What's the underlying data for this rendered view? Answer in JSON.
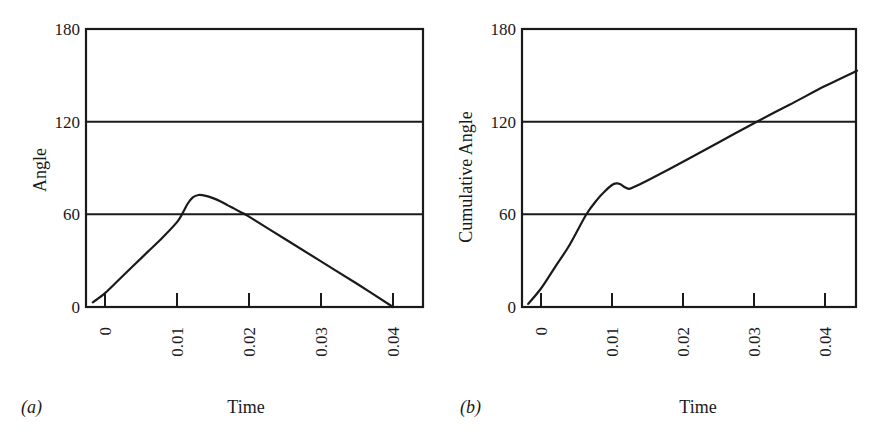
{
  "chart_data": [
    {
      "id": "a",
      "type": "line",
      "panel_label": "(a)",
      "title": "",
      "xlabel": "Time",
      "ylabel": "Angle",
      "xlim": [
        -0.0026,
        0.0442
      ],
      "ylim": [
        0,
        180
      ],
      "x_ticks": [
        0,
        0.01,
        0.02,
        0.03,
        0.04
      ],
      "x_tick_labels": [
        "0",
        "0.01",
        "0.02",
        "0.03",
        "0.04"
      ],
      "y_ticks": [
        0,
        60,
        120,
        180
      ],
      "y_tick_labels": [
        "0",
        "60",
        "120",
        "180"
      ],
      "horizontal_gridlines": [
        60,
        120
      ],
      "legend": null,
      "series": [
        {
          "name": "Angle",
          "x": [
            -0.0017,
            0.0,
            0.002,
            0.004,
            0.006,
            0.008,
            0.01,
            0.0108,
            0.0115,
            0.0122,
            0.013,
            0.014,
            0.015,
            0.016,
            0.017,
            0.018,
            0.019,
            0.02,
            0.025,
            0.03,
            0.035,
            0.04
          ],
          "y": [
            3,
            9,
            18,
            27,
            36,
            45,
            55,
            61,
            67,
            71,
            72.5,
            72,
            70.5,
            68.5,
            66,
            63.5,
            61,
            58.5,
            44,
            29.5,
            15,
            0
          ]
        }
      ]
    },
    {
      "id": "b",
      "type": "line",
      "panel_label": "(b)",
      "title": "",
      "xlabel": "Time",
      "ylabel": "Cumulative Angle",
      "xlim": [
        -0.0026,
        0.0443
      ],
      "ylim": [
        0,
        180
      ],
      "x_ticks": [
        0,
        0.01,
        0.02,
        0.03,
        0.04
      ],
      "x_tick_labels": [
        "0",
        "0.01",
        "0.02",
        "0.03",
        "0.04"
      ],
      "y_ticks": [
        0,
        60,
        120,
        180
      ],
      "y_tick_labels": [
        "0",
        "60",
        "120",
        "180"
      ],
      "horizontal_gridlines": [
        60,
        120
      ],
      "legend": null,
      "series": [
        {
          "name": "Cumulative Angle",
          "x": [
            -0.0018,
            0.0,
            0.002,
            0.004,
            0.0064,
            0.008,
            0.009,
            0.01,
            0.0106,
            0.0112,
            0.0118,
            0.0124,
            0.013,
            0.015,
            0.02,
            0.025,
            0.0304,
            0.035,
            0.04,
            0.0445
          ],
          "y": [
            2,
            12,
            26,
            40,
            60,
            70,
            75,
            79,
            80,
            79.5,
            77.5,
            76.5,
            77.5,
            82,
            94,
            106.5,
            120,
            131,
            143,
            153
          ]
        }
      ]
    }
  ]
}
